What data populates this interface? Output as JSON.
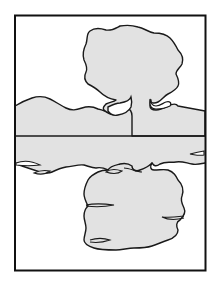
{
  "illustration": {
    "subject": "tree and hills reflected in water",
    "colors": {
      "background": "#ffffff",
      "fill": "#e2e2e2",
      "ink": "#1a1a1a"
    },
    "frame": {
      "x": 14,
      "y": 15,
      "width": 192,
      "height": 256
    },
    "horizon_y": 136
  }
}
